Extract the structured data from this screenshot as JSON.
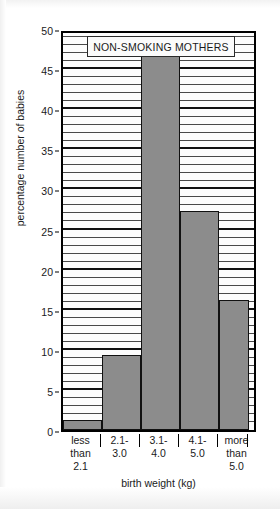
{
  "chart_data": {
    "type": "bar",
    "title": "NON-SMOKING MOTHERS",
    "xlabel": "birth weight (kg)",
    "ylabel": "percentage number of babies",
    "categories": [
      "less\nthan\n2.1",
      "2.1-\n3.0",
      "3.1-\n4.0",
      "4.1-\n5.0",
      "more\nthan\n5.0"
    ],
    "category_lines": [
      [
        "less",
        "than",
        "2.1"
      ],
      [
        "2.1-",
        "3.0"
      ],
      [
        "3.1-",
        "4.0"
      ],
      [
        "4.1-",
        "5.0"
      ],
      [
        "more",
        "than",
        "5.0"
      ]
    ],
    "values": [
      1.2,
      9.3,
      47.0,
      27.3,
      16.2
    ],
    "ylim": [
      0,
      50
    ],
    "ytick_labels": [
      "0",
      "5",
      "10",
      "15",
      "20",
      "25",
      "30",
      "35",
      "40",
      "45",
      "50"
    ],
    "ytick_values": [
      0,
      5,
      10,
      15,
      20,
      25,
      30,
      35,
      40,
      45,
      50
    ],
    "grid": "horizontal lines every 1 unit, heavier every 5 units",
    "legend": "none",
    "bar_fill_color": "#8c8c8c",
    "bar_edge_color": "#111111",
    "frame_color": "#000000",
    "background_color": "#ffffff"
  }
}
